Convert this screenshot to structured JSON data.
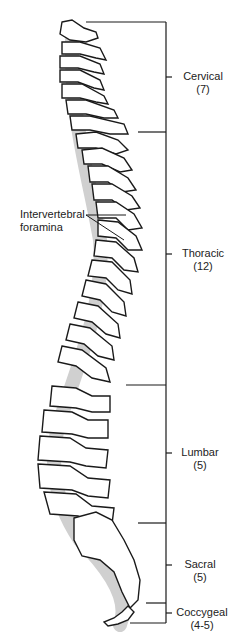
{
  "diagram": {
    "annotations": {
      "foramina": {
        "line1": "Intervertebral",
        "line2": "foramina"
      }
    },
    "regions": [
      {
        "name": "Cervical",
        "count": "(7)"
      },
      {
        "name": "Thoracic",
        "count": "(12)"
      },
      {
        "name": "Lumbar",
        "count": "(5)"
      },
      {
        "name": "Sacral",
        "count": "(5)"
      },
      {
        "name": "Coccygeal",
        "count": "(4-5)"
      }
    ],
    "colors": {
      "line": "#1a1a1a",
      "fill": "#ffffff",
      "shade": "#d0d0d0"
    }
  }
}
